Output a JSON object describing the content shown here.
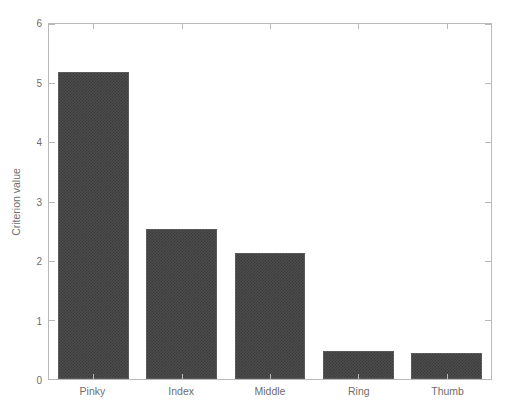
{
  "chart_data": {
    "type": "bar",
    "title": "",
    "xlabel": "",
    "ylabel": "Criterion value",
    "categories": [
      "Pinky",
      "Index",
      "Middle",
      "Ring",
      "Thumb"
    ],
    "values": [
      5.19,
      2.54,
      2.13,
      0.47,
      0.44
    ],
    "ylim": [
      0,
      6
    ],
    "yticks": [
      0,
      1,
      2,
      3,
      4,
      5,
      6
    ],
    "ytick_labels": [
      "0",
      "1",
      "2",
      "3",
      "4",
      "5",
      "6"
    ],
    "grid": false,
    "legend": null,
    "bar_color": "#4d4d4d",
    "axis_color": "#b9b9b9",
    "text_color": "#6e6e6e",
    "background": "#ffffff",
    "annotations": []
  }
}
